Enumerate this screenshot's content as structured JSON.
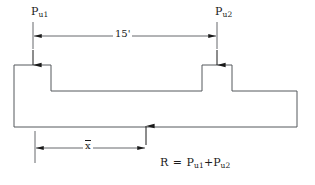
{
  "diagram": {
    "stroke_color": "#55585c",
    "text_color": "#1a1a1a",
    "labels": {
      "load_left": {
        "base": "P",
        "sub": "u1"
      },
      "load_right": {
        "base": "P",
        "sub": "u2"
      },
      "span_dimension": "15'",
      "centroid_dimension": "x",
      "reaction_equation": {
        "lhs": "R",
        "equals": "=",
        "term1_base": "P",
        "term1_sub": "u1",
        "plus": "+",
        "term2_base": "P",
        "term2_sub": "u2"
      }
    },
    "geometry": {
      "slab_left": 14,
      "slab_right": 297,
      "slab_top": 91,
      "slab_bottom": 127,
      "left_pedestal": {
        "x1": 14,
        "x2": 51,
        "top": 65
      },
      "right_pedestal": {
        "x1": 202,
        "x2": 232,
        "top": 65
      },
      "span_line_y": 36,
      "span_line_x1": 33,
      "span_line_x2": 217,
      "centroid_line_y": 148,
      "centroid_line_x1": 35,
      "centroid_line_x2": 146,
      "reaction_arrow_x": 146
    }
  }
}
